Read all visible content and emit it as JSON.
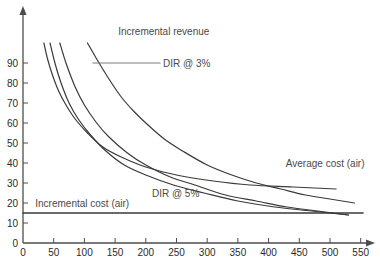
{
  "chart_data": {
    "type": "line",
    "title": "",
    "xlabel": "",
    "ylabel": "",
    "xlim": [
      0,
      580
    ],
    "ylim": [
      0,
      100
    ],
    "xticks": [
      0,
      50,
      100,
      150,
      200,
      250,
      300,
      350,
      400,
      450,
      500,
      550
    ],
    "yticks": [
      0,
      10,
      20,
      30,
      40,
      50,
      60,
      70,
      80,
      90
    ],
    "grid": false,
    "legend_position": "inline-annotations",
    "axis_arrows": true,
    "series": [
      {
        "name": "Incremental revenue",
        "label_text": "Incremental revenue",
        "label_x": 155,
        "label_y": 106,
        "leader_line": false,
        "x": [
          105,
          120,
          140,
          160,
          180,
          200,
          230,
          260,
          300,
          340,
          380,
          420,
          460,
          500,
          540,
          580
        ],
        "y": [
          100,
          92,
          82,
          73,
          66,
          60,
          52,
          46,
          39,
          34,
          30,
          27,
          24,
          22,
          20,
          19
        ]
      },
      {
        "name": "DIR @ 3%",
        "label_text": "DIR @ 3%",
        "label_x": 228,
        "label_y": 90,
        "leader_line": true,
        "leader_x1": 113,
        "leader_x2": 224,
        "leader_y": 90,
        "x": [
          60,
          70,
          85,
          100,
          120,
          140,
          170,
          200,
          240,
          280,
          330,
          380,
          430,
          480,
          530,
          580
        ],
        "y": [
          100,
          90,
          78,
          69,
          60,
          53,
          45,
          39,
          33,
          29,
          24,
          21,
          18,
          16,
          14,
          13
        ]
      },
      {
        "name": "DIR @ 5%",
        "label_text": "DIR @ 5%",
        "label_x": 210,
        "label_y": 25,
        "leader_line": false,
        "x": [
          44,
          52,
          62,
          75,
          90,
          110,
          135,
          165,
          200,
          245,
          295,
          350,
          410,
          470,
          530,
          580
        ],
        "y": [
          100,
          90,
          80,
          70,
          62,
          54,
          46,
          39,
          34,
          29,
          25,
          21,
          18,
          16,
          14,
          12
        ]
      },
      {
        "name": "Average cost (air)",
        "label_text": "Average cost (air)",
        "label_x": 428,
        "label_y": 40,
        "leader_line": false,
        "x": [
          34,
          40,
          48,
          58,
          70,
          85,
          105,
          130,
          160,
          200,
          250,
          310,
          370,
          440,
          510,
          580
        ],
        "y": [
          100,
          92,
          84,
          76,
          69,
          62,
          55,
          48,
          43,
          38,
          34,
          31,
          29,
          28,
          27,
          26
        ]
      },
      {
        "name": "Incremental cost (air)",
        "label_text": "Incremental cost (air)",
        "label_x": 20,
        "label_y": 20,
        "leader_line": false,
        "constant": 15,
        "x": [
          0,
          580
        ],
        "y": [
          15,
          15
        ]
      }
    ]
  },
  "axis": {
    "x_tick_labels": [
      "0",
      "50",
      "100",
      "150",
      "200",
      "250",
      "300",
      "350",
      "400",
      "450",
      "500",
      "550"
    ],
    "y_tick_labels": [
      "0",
      "10",
      "20",
      "30",
      "40",
      "50",
      "60",
      "70",
      "80",
      "90"
    ]
  },
  "annotations": {
    "incremental_revenue": "Incremental revenue",
    "dir_3": "DIR @ 3%",
    "dir_5": "DIR @ 5%",
    "average_cost_air": "Average cost (air)",
    "incremental_cost_air": "Incremental cost (air)"
  },
  "colors": {
    "curve": "#3a3a3a",
    "axis": "#4d4d4d",
    "text": "#3a3a3a",
    "leader": "#6e6e6e",
    "background": "#ffffff"
  }
}
